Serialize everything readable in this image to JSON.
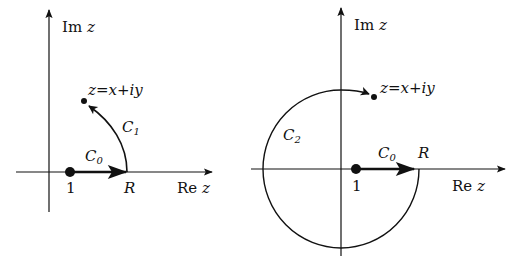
{
  "left_diagram": {
    "axis_x_label_re": "Re",
    "axis_x_label_var": "z",
    "axis_y_label_im": "Im",
    "axis_y_label_var": "z",
    "point_label": "z=x+iy",
    "start_label": "1",
    "radius_label": "R",
    "path0_label": "C",
    "path0_sub": "0",
    "path1_label": "C",
    "path1_sub": "1"
  },
  "right_diagram": {
    "axis_x_label_re": "Re",
    "axis_x_label_var": "z",
    "axis_y_label_im": "Im",
    "axis_y_label_var": "z",
    "point_label": "z=x+iy",
    "start_label": "1",
    "radius_label": "R",
    "path0_label": "C",
    "path0_sub": "0",
    "path2_label": "C",
    "path2_sub": "2"
  },
  "colors": {
    "ink": "#111111",
    "background": "#ffffff"
  }
}
